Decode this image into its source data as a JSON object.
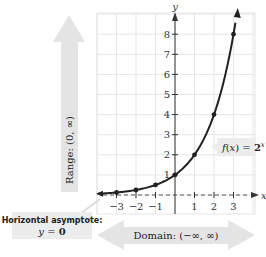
{
  "chart_data": {
    "type": "line",
    "title": "",
    "function_label": "f(x) = 2^x",
    "function_label_parts": {
      "prefix": "f(x) = ",
      "base": "2",
      "exponent": "x"
    },
    "xlabel": "x",
    "ylabel": "y",
    "xlim": [
      -4,
      4
    ],
    "ylim": [
      0,
      9
    ],
    "x_ticks": [
      -3,
      -2,
      -1,
      1,
      2,
      3
    ],
    "y_ticks": [
      1,
      2,
      3,
      4,
      5,
      6,
      7,
      8
    ],
    "grid": true,
    "series": [
      {
        "name": "f(x) = 2^x",
        "points": [
          {
            "x": -3,
            "y": 0.125
          },
          {
            "x": -2,
            "y": 0.25
          },
          {
            "x": -1,
            "y": 0.5
          },
          {
            "x": 0,
            "y": 1
          },
          {
            "x": 1,
            "y": 2
          },
          {
            "x": 2,
            "y": 4
          },
          {
            "x": 3,
            "y": 8
          }
        ]
      }
    ],
    "annotations": {
      "range": "Range: (0, ∞)",
      "domain": "Domain: (−∞, ∞)",
      "asymptote_title": "Horizontal asymptote:",
      "asymptote_eq_prefix": "y = ",
      "asymptote_eq_value": "0"
    }
  },
  "colors": {
    "curve": "#222222",
    "grid": "#e6e6e6",
    "arrow_fill": "#e4e4e4",
    "label_box": "#ececec",
    "asymptote": "#555555"
  }
}
